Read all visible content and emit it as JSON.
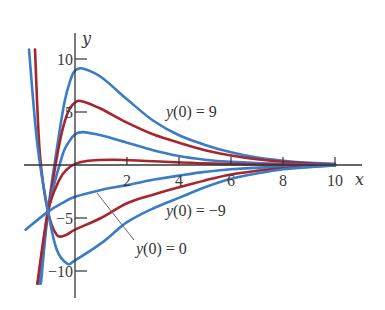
{
  "chart_data": {
    "type": "line",
    "title": "",
    "xlabel": "x",
    "ylabel": "y",
    "xlim": [
      -2,
      10.5
    ],
    "ylim": [
      -12,
      12
    ],
    "grid": false,
    "legend": "none",
    "x_ticks": [
      2,
      4,
      6,
      8,
      10
    ],
    "x_tick_labels": [
      "2",
      "4",
      "6",
      "8",
      "10"
    ],
    "y_ticks": [
      10,
      5,
      -5,
      -10
    ],
    "y_tick_labels": [
      "10",
      "5",
      "−5",
      "−10"
    ],
    "colors": {
      "blue": "#3a7cc8",
      "red": "#a8262b",
      "axis": "#333333"
    },
    "annotations": [
      {
        "text": "y(0) = 9",
        "x": 3.5,
        "y": 5.1
      },
      {
        "text": "y(0) = −9",
        "x": 3.5,
        "y": -4.3
      },
      {
        "text": "y(0) = 0",
        "x": 2.3,
        "y": -7.9,
        "leader_from": [
          0.85,
          -2.6
        ],
        "leader_to": [
          2.27,
          -7.1
        ]
      }
    ],
    "series": [
      {
        "name": "y(0)=9",
        "y0": 9,
        "color": "blue",
        "points": [
          [
            -1.31,
            -11.2
          ],
          [
            -1.04,
            -4.4
          ],
          [
            -0.7,
            1.5
          ],
          [
            -0.4,
            6.0
          ],
          [
            -0.15,
            8.2
          ],
          [
            0,
            8.9
          ],
          [
            0.3,
            9.1
          ],
          [
            1,
            8.3
          ],
          [
            2,
            6.2
          ],
          [
            3,
            4.2
          ],
          [
            4,
            2.8
          ],
          [
            5,
            1.9
          ],
          [
            6,
            1.2
          ],
          [
            7,
            0.7
          ],
          [
            8,
            0.4
          ],
          [
            9,
            0.2
          ],
          [
            10,
            0.1
          ]
        ]
      },
      {
        "name": "y(0)=6",
        "y0": 6,
        "color": "red",
        "points": [
          [
            -1.43,
            -11.2
          ],
          [
            -1.04,
            -4.4
          ],
          [
            -0.6,
            2.0
          ],
          [
            -0.3,
            4.8
          ],
          [
            0,
            5.9
          ],
          [
            0.3,
            6.0
          ],
          [
            1,
            5.3
          ],
          [
            2,
            4.0
          ],
          [
            3,
            2.9
          ],
          [
            4,
            2.1
          ],
          [
            5,
            1.4
          ],
          [
            6,
            0.9
          ],
          [
            7,
            0.55
          ],
          [
            8,
            0.3
          ],
          [
            9,
            0.15
          ],
          [
            10,
            0.05
          ]
        ]
      },
      {
        "name": "y(0)=3",
        "y0": 3,
        "color": "blue",
        "points": [
          [
            -1.38,
            -11.2
          ],
          [
            -1.04,
            -4.4
          ],
          [
            -0.5,
            0.8
          ],
          [
            -0.2,
            2.3
          ],
          [
            0,
            2.9
          ],
          [
            0.3,
            3.1
          ],
          [
            1,
            2.8
          ],
          [
            2,
            2.1
          ],
          [
            3,
            1.4
          ],
          [
            4,
            0.85
          ],
          [
            5,
            0.5
          ],
          [
            6,
            0.3
          ],
          [
            8,
            0.1
          ],
          [
            10,
            0.02
          ]
        ]
      },
      {
        "name": "y(0)=0",
        "y0": 0,
        "color": "red",
        "points": [
          [
            -1.45,
            -11.2
          ],
          [
            -1.04,
            -4.4
          ],
          [
            -0.6,
            -1.4
          ],
          [
            -0.3,
            -0.4
          ],
          [
            0,
            0.1
          ],
          [
            0.5,
            0.4
          ],
          [
            1.5,
            0.5
          ],
          [
            3,
            0.35
          ],
          [
            5,
            0.15
          ],
          [
            7,
            0.05
          ],
          [
            10,
            0.0
          ]
        ]
      },
      {
        "name": "y(0)=-3",
        "y0": -3,
        "color": "blue",
        "points": [
          [
            -1.9,
            -6.1
          ],
          [
            -1.04,
            -4.4
          ],
          [
            -0.5,
            -3.6
          ],
          [
            0,
            -3.0
          ],
          [
            1,
            -2.35
          ],
          [
            2,
            -1.9
          ],
          [
            3,
            -1.4
          ],
          [
            4,
            -1.0
          ],
          [
            5,
            -0.65
          ],
          [
            6,
            -0.4
          ],
          [
            8,
            -0.15
          ],
          [
            10,
            -0.03
          ]
        ]
      },
      {
        "name": "y(0)=-6",
        "y0": -6,
        "color": "red",
        "points": [
          [
            -1.54,
            10.9
          ],
          [
            -1.35,
            1.0
          ],
          [
            -1.04,
            -4.4
          ],
          [
            -0.7,
            -6.6
          ],
          [
            -0.35,
            -6.6
          ],
          [
            0,
            -6.1
          ],
          [
            1,
            -5.0
          ],
          [
            2,
            -3.6
          ],
          [
            3,
            -2.8
          ],
          [
            4,
            -2.1
          ],
          [
            5,
            -1.45
          ],
          [
            6,
            -0.9
          ],
          [
            7,
            -0.55
          ],
          [
            8,
            -0.3
          ],
          [
            9,
            -0.15
          ],
          [
            10,
            -0.05
          ]
        ]
      },
      {
        "name": "y(0)=-9",
        "y0": -9,
        "color": "blue",
        "points": [
          [
            -1.77,
            10.9
          ],
          [
            -1.45,
            2.0
          ],
          [
            -1.04,
            -4.4
          ],
          [
            -0.7,
            -8.0
          ],
          [
            -0.3,
            -9.3
          ],
          [
            0,
            -9.0
          ],
          [
            1,
            -7.4
          ],
          [
            2,
            -5.4
          ],
          [
            3,
            -4.1
          ],
          [
            4,
            -3.1
          ],
          [
            5,
            -2.1
          ],
          [
            6,
            -1.3
          ],
          [
            7,
            -0.8
          ],
          [
            8,
            -0.4
          ],
          [
            9,
            -0.2
          ],
          [
            10,
            -0.05
          ]
        ]
      }
    ]
  },
  "labels": {
    "x_axis": "x",
    "y_axis": "y",
    "ann_pos9": "y(0) = 9",
    "ann_neg9": "y(0) = −9",
    "ann_zero": "y(0) = 0"
  }
}
